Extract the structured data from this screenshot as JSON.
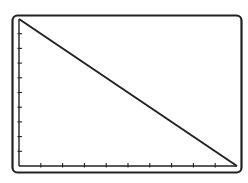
{
  "chart_data": {
    "type": "line",
    "title": "",
    "xlabel": "",
    "ylabel": "",
    "x_ticks": 9,
    "y_ticks": 9,
    "tick_labels_x": [],
    "tick_labels_y": [],
    "grid": false,
    "legend": null,
    "xlim": [
      0,
      10
    ],
    "ylim": [
      0,
      10
    ],
    "series": [
      {
        "name": "line",
        "x": [
          0,
          10
        ],
        "values": [
          10,
          0
        ]
      }
    ]
  },
  "style": {
    "stroke": "#222222",
    "background": "#ffffff"
  }
}
